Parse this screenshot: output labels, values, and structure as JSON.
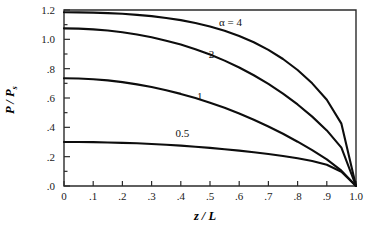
{
  "chart_data": {
    "type": "line",
    "title": "",
    "xlabel": "z / L",
    "ylabel": "P / P s",
    "ylabel_main": "P / P",
    "ylabel_subscript": "s",
    "xlim": [
      0,
      1.0
    ],
    "ylim": [
      0,
      1.2
    ],
    "grid": false,
    "legend_position": "inline-annotations",
    "x_tick_labels": [
      "0",
      ".1",
      ".2",
      ".3",
      ".4",
      ".5",
      ".6",
      ".7",
      ".8",
      ".9",
      "1.0"
    ],
    "x_tick_values": [
      0,
      0.1,
      0.2,
      0.3,
      0.4,
      0.5,
      0.6,
      0.7,
      0.8,
      0.9,
      1.0
    ],
    "y_tick_labels": [
      "1.2",
      "1.0",
      ".8",
      ".6",
      ".4",
      ".2",
      ".0"
    ],
    "y_tick_values": [
      1.2,
      1.0,
      0.8,
      0.6,
      0.4,
      0.2,
      0.0
    ],
    "y_minor_tick_values": [
      1.1,
      0.9,
      0.7,
      0.5,
      0.3,
      0.1
    ],
    "x": [
      0,
      0.05,
      0.1,
      0.15,
      0.2,
      0.25,
      0.3,
      0.35,
      0.4,
      0.45,
      0.5,
      0.55,
      0.6,
      0.65,
      0.7,
      0.75,
      0.8,
      0.85,
      0.9,
      0.95,
      1.0
    ],
    "series": [
      {
        "name": "alpha-4",
        "label": "α = 4",
        "alpha": 4,
        "label_x": 0.57,
        "label_y": 1.09,
        "values": [
          1.185,
          1.184,
          1.182,
          1.179,
          1.174,
          1.167,
          1.158,
          1.146,
          1.131,
          1.112,
          1.088,
          1.059,
          1.023,
          0.98,
          0.928,
          0.866,
          0.791,
          0.7,
          0.588,
          0.425,
          0.0
        ]
      },
      {
        "name": "alpha-2",
        "label": "2",
        "alpha": 2,
        "label_x": 0.505,
        "label_y": 0.875,
        "values": [
          1.075,
          1.073,
          1.068,
          1.06,
          1.048,
          1.033,
          1.014,
          0.991,
          0.964,
          0.932,
          0.896,
          0.855,
          0.808,
          0.755,
          0.696,
          0.63,
          0.556,
          0.473,
          0.379,
          0.262,
          0.0
        ]
      },
      {
        "name": "alpha-1",
        "label": "1",
        "alpha": 1,
        "label_x": 0.465,
        "label_y": 0.585,
        "values": [
          0.735,
          0.733,
          0.728,
          0.72,
          0.708,
          0.693,
          0.675,
          0.653,
          0.628,
          0.6,
          0.568,
          0.533,
          0.494,
          0.452,
          0.406,
          0.356,
          0.302,
          0.244,
          0.181,
          0.105,
          0.0
        ]
      },
      {
        "name": "alpha-0p5",
        "label": "0.5",
        "alpha": 0.5,
        "label_x": 0.405,
        "label_y": 0.335,
        "values": [
          0.3,
          0.3,
          0.299,
          0.297,
          0.294,
          0.291,
          0.286,
          0.281,
          0.275,
          0.268,
          0.26,
          0.251,
          0.241,
          0.23,
          0.218,
          0.205,
          0.189,
          0.17,
          0.145,
          0.097,
          0.0
        ]
      }
    ]
  }
}
